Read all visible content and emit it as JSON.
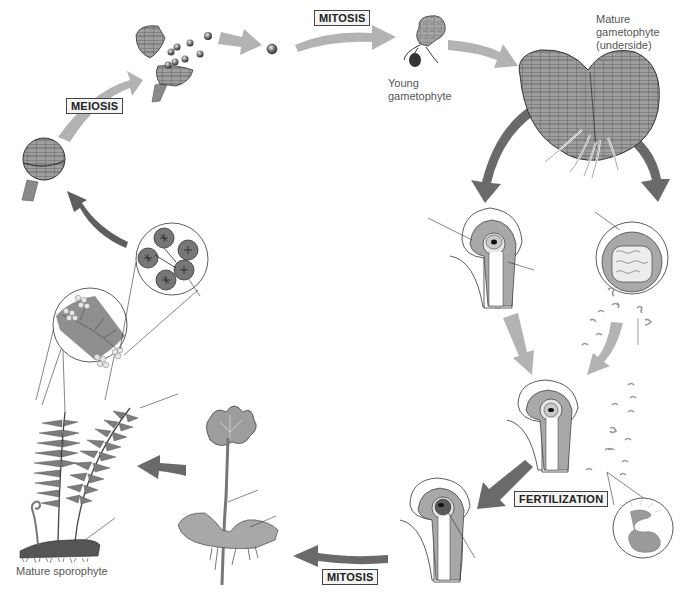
{
  "diagram": {
    "colors": {
      "light_arrow": "#b5b5b5",
      "dark_arrow": "#6a6a6a",
      "tissue_fill": "#9a9a9a",
      "cell_fill": "#b0b0b0",
      "outline": "#333333",
      "label_text": "#555555",
      "background": "#ffffff"
    },
    "stages": [
      {
        "id": "meiosis",
        "label": "MEIOSIS",
        "x": 63,
        "y": 98
      },
      {
        "id": "mitosis-top",
        "label": "MITOSIS",
        "x": 312,
        "y": 10
      },
      {
        "id": "fertilization",
        "label": "FERTILIZATION",
        "x": 513,
        "y": 491
      },
      {
        "id": "mitosis-bottom",
        "label": "MITOSIS",
        "x": 321,
        "y": 568
      }
    ],
    "labels": [
      {
        "id": "young-gametophyte",
        "text_lines": [
          "Young",
          "gametophyte"
        ],
        "x": 387,
        "y": 78
      },
      {
        "id": "mature-gametophyte",
        "text_lines": [
          "Mature",
          "gametophyte",
          "(underside)"
        ],
        "x": 596,
        "y": 12
      },
      {
        "id": "mature-sporophyte",
        "text_lines": [
          "Mature sporophyte"
        ],
        "x": 16,
        "y": 565
      }
    ],
    "structures": [
      "sporangium-closed",
      "sporangium-releasing-spores",
      "spores",
      "spore",
      "young-gametophyte",
      "mature-gametophyte",
      "archegonium",
      "antheridium",
      "sperm-cells",
      "archegonium-with-egg",
      "sperm-magnified",
      "zygote-in-archegonium",
      "young-sporophyte",
      "mature-sporophyte-fern",
      "sori-on-frond-magnified",
      "sporangia-magnified"
    ]
  }
}
